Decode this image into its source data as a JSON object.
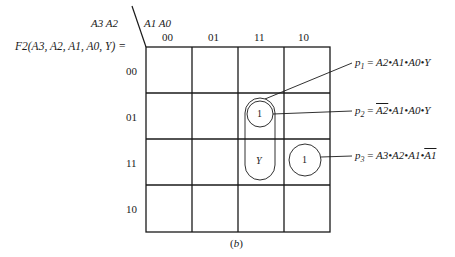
{
  "function_label": "F2(A3, A2, A1, A0, Y) =",
  "row_var_label": "A3 A2",
  "col_var_label": "A1 A0",
  "columns": [
    "00",
    "01",
    "11",
    "10"
  ],
  "rows": [
    "00",
    "01",
    "11",
    "10"
  ],
  "cells": [
    {
      "row": "01",
      "col": "11",
      "value": "1"
    },
    {
      "row": "11",
      "col": "11",
      "value": "Y"
    },
    {
      "row": "11",
      "col": "10",
      "value": "1"
    }
  ],
  "terms": [
    {
      "name": "p",
      "sub": "1",
      "eq": "=",
      "expr_parts": [
        {
          "t": "A2",
          "bar": false
        },
        {
          "t": "•A1•A0•Y",
          "bar": false
        }
      ]
    },
    {
      "name": "p",
      "sub": "2",
      "eq": "=",
      "expr_parts": [
        {
          "t": "A2",
          "bar": true
        },
        {
          "t": "•A1•A0•Y",
          "bar": false
        }
      ]
    },
    {
      "name": "p",
      "sub": "3",
      "eq": "=",
      "expr_parts": [
        {
          "t": "A3•A2•A1•",
          "bar": false
        },
        {
          "t": "A1",
          "bar": true
        }
      ]
    }
  ],
  "caption": "(b)",
  "colors": {
    "line": "#1a1a1a",
    "background": "#ffffff"
  }
}
